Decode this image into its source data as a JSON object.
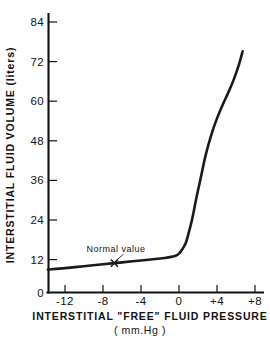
{
  "chart_data": {
    "type": "line",
    "title": "",
    "xlabel": "INTERSTITIAL \"FREE\" FLUID PRESSURE",
    "xunits": "( mm.Hg )",
    "ylabel": "INTERSTITIAL FLUID VOLUME (liters)",
    "xlim": [
      -13.8,
      8
    ],
    "ylim": [
      0,
      90
    ],
    "xticks": [
      -12,
      -8,
      -4,
      0,
      4,
      8
    ],
    "xtick_labels": [
      "-12",
      "-8",
      "-4",
      "0",
      "+4",
      "+8"
    ],
    "yticks": [
      0,
      12,
      24,
      36,
      48,
      60,
      72,
      84
    ],
    "ytick_labels": [
      "0",
      "12",
      "24",
      "36",
      "48",
      "60",
      "72",
      "84"
    ],
    "grid": false,
    "legend": null,
    "tick_direction": "in",
    "spines": [
      "left",
      "bottom"
    ],
    "series": [
      {
        "name": "Interstitial fluid volume",
        "x": [
          -13.8,
          -12.0,
          -10.0,
          -8.0,
          -6.8,
          -6.0,
          -4.0,
          -2.5,
          -1.5,
          -0.8,
          -0.3,
          0.0,
          0.3,
          0.7,
          1.0,
          1.4,
          1.8,
          2.3,
          2.8,
          3.4,
          4.0,
          4.6,
          5.2,
          5.8,
          6.3,
          6.7
        ],
        "y": [
          8.4,
          8.9,
          9.6,
          10.3,
          10.7,
          11.0,
          11.7,
          12.2,
          12.6,
          13.0,
          13.5,
          14.2,
          15.5,
          18.0,
          21.5,
          27.0,
          34.0,
          42.0,
          50.0,
          57.5,
          63.5,
          68.5,
          73.0,
          78.0,
          83.0,
          88.0
        ]
      }
    ],
    "annotations": [
      {
        "text": "Normal value",
        "point_x": -6.8,
        "point_y": 10.7,
        "marker": "x"
      }
    ]
  },
  "axis": {
    "y_title": "INTERSTITIAL FLUID VOLUME (liters)",
    "x_title": "INTERSTITIAL \"FREE\" FLUID PRESSURE",
    "x_units": "( mm.Hg )"
  },
  "annotation": {
    "normal_value_label": "Normal value"
  }
}
